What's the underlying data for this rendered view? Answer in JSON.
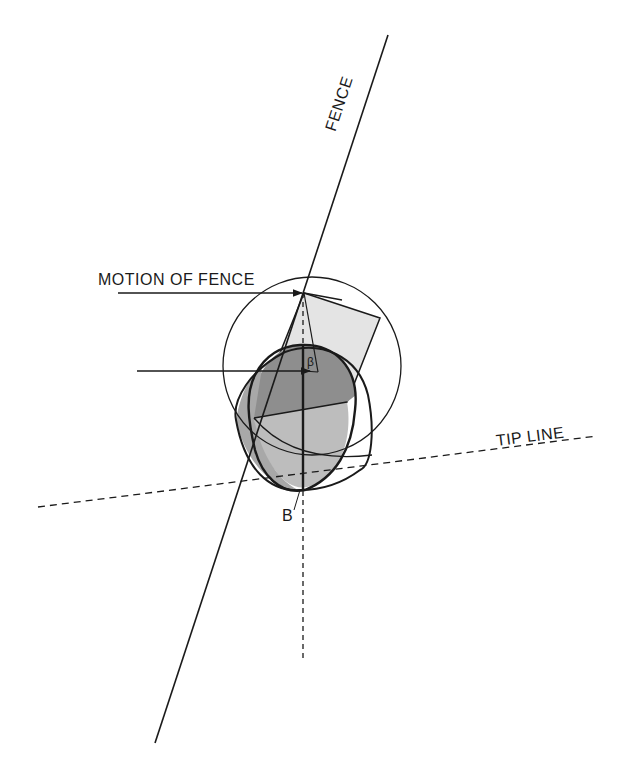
{
  "labels": {
    "fence": "FENCE",
    "motion_of_fence": "MOTION OF FENCE",
    "tip_line": "TIP LINE",
    "point_b": "B",
    "angle": "β"
  },
  "colors": {
    "stroke": "#1a1a1a",
    "light_fill": "#e2e2e2",
    "mid_fill": "#b8b8b8",
    "dark_fill": "#8f8f8f"
  }
}
